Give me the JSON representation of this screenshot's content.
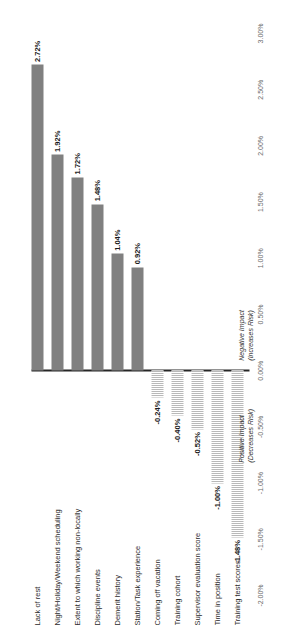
{
  "chart_data": {
    "type": "bar",
    "title": "",
    "subtitle": "",
    "xlabel": "",
    "ylabel": "",
    "orientation": "rotated-vertical-bars",
    "grid": false,
    "legend": false,
    "value_axis": {
      "min": -0.02,
      "max": 0.03,
      "step": 0.005,
      "tick_labels": [
        "-2.00%",
        "-1.50%",
        "-1.00%",
        "-0.50%",
        "0.00%",
        "0.50%",
        "1.00%",
        "1.50%",
        "2.00%",
        "2.50%",
        "3.00%"
      ],
      "tick_values": [
        -0.02,
        -0.015,
        -0.01,
        -0.005,
        0.0,
        0.005,
        0.01,
        0.015,
        0.02,
        0.025,
        0.03
      ]
    },
    "categories": [
      "Lack of rest",
      "Night/Holiday/Weekend scheduling",
      "Extent to which working non-locally",
      "Discipline events",
      "Demerit history",
      "Station/Task experience",
      "Coming off vacation",
      "Training cohort",
      "Supervisor evaluation score",
      "Time in position",
      "Training test scores"
    ],
    "values": [
      0.0272,
      0.0192,
      0.0172,
      0.0148,
      0.0104,
      0.0092,
      -0.0024,
      -0.004,
      -0.0052,
      -0.01,
      -0.0148
    ],
    "value_labels": [
      "2.72%",
      "1.92%",
      "1.72%",
      "1.48%",
      "1.04%",
      "0.92%",
      "-0.24%",
      "-0.40%",
      "-0.52%",
      "-1.00%",
      "-1.48%"
    ],
    "annotations": [
      {
        "line1": "Negative Impact",
        "line2": "(Increases Risk)"
      },
      {
        "line1": "Positive Impact",
        "line2": "(Decreases Risk)"
      }
    ],
    "colors": {
      "positive_bar": "#808080",
      "negative_bar_hatch": "#b9b9b9",
      "axis_line": "#262626",
      "tick_text": "#6b6b6b",
      "category_text": "#2b2b2b",
      "value_text": "#1a1a1a"
    }
  }
}
